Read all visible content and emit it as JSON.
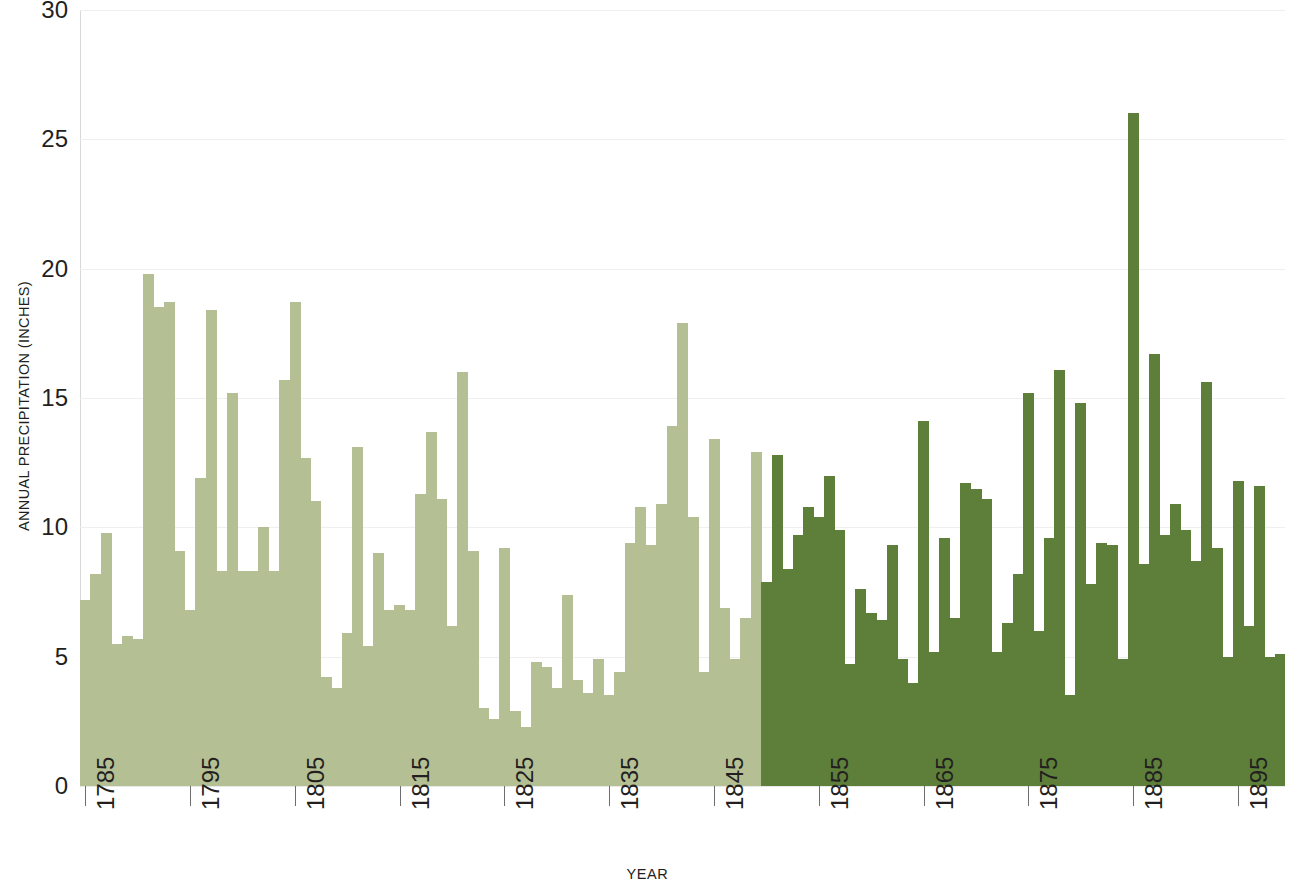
{
  "chart_data": {
    "type": "bar",
    "title": "",
    "subtitle": "",
    "xlabel": "YEAR",
    "ylabel": "ANNUAL PRECIPITATION (INCHES)",
    "ylabel_first_letters": "APRECIPITATIONINCHES",
    "ylim": [
      0,
      30
    ],
    "xlim": [
      1785,
      1899
    ],
    "y_ticks": [
      0,
      5,
      10,
      15,
      20,
      25,
      30
    ],
    "y_tick_labels": [
      "0",
      "5",
      "10",
      "15",
      "20",
      "25",
      "30"
    ],
    "x_ticks": [
      1785,
      1795,
      1805,
      1815,
      1825,
      1835,
      1845,
      1855,
      1865,
      1875,
      1885,
      1895
    ],
    "x_tick_labels": [
      "1785",
      "1795",
      "1805",
      "1815",
      "1825",
      "1835",
      "1845",
      "1855",
      "1865",
      "1875",
      "1885",
      "1895"
    ],
    "grid": true,
    "grid_axis": "y",
    "legend": false,
    "bar_gap": 0,
    "series": [
      {
        "name": "Annual precipitation (early period)",
        "color": "#b5bf94",
        "year_range": [
          1785,
          1849
        ]
      },
      {
        "name": "Annual precipitation (later period)",
        "color": "#5d7f3a",
        "year_range": [
          1850,
          1899
        ]
      }
    ],
    "color_split_year": 1850,
    "categories": [
      1785,
      1786,
      1787,
      1788,
      1789,
      1790,
      1791,
      1792,
      1793,
      1794,
      1795,
      1796,
      1797,
      1798,
      1799,
      1800,
      1801,
      1802,
      1803,
      1804,
      1805,
      1806,
      1807,
      1808,
      1809,
      1810,
      1811,
      1812,
      1813,
      1814,
      1815,
      1816,
      1817,
      1818,
      1819,
      1820,
      1821,
      1822,
      1823,
      1824,
      1825,
      1826,
      1827,
      1828,
      1829,
      1830,
      1831,
      1832,
      1833,
      1834,
      1835,
      1836,
      1837,
      1838,
      1839,
      1840,
      1841,
      1842,
      1843,
      1844,
      1845,
      1846,
      1847,
      1848,
      1849,
      1850,
      1851,
      1852,
      1853,
      1854,
      1855,
      1856,
      1857,
      1858,
      1859,
      1860,
      1861,
      1862,
      1863,
      1864,
      1865,
      1866,
      1867,
      1868,
      1869,
      1870,
      1871,
      1872,
      1873,
      1874,
      1875,
      1876,
      1877,
      1878,
      1879,
      1880,
      1881,
      1882,
      1883,
      1884,
      1885,
      1886,
      1887,
      1888,
      1889,
      1890,
      1891,
      1892,
      1893,
      1894,
      1895,
      1896,
      1897,
      1898,
      1899
    ],
    "values": [
      7.2,
      8.2,
      9.8,
      5.5,
      5.8,
      5.7,
      19.8,
      18.5,
      18.7,
      9.1,
      6.8,
      11.9,
      18.4,
      8.3,
      15.2,
      8.3,
      8.3,
      10.0,
      8.3,
      15.7,
      18.7,
      12.7,
      11.0,
      4.2,
      3.8,
      5.9,
      13.1,
      5.4,
      9.0,
      6.8,
      7.0,
      6.8,
      11.3,
      13.7,
      11.1,
      6.2,
      16.0,
      9.1,
      3.0,
      2.6,
      9.2,
      2.9,
      2.3,
      4.8,
      4.6,
      3.8,
      7.4,
      4.1,
      3.6,
      4.9,
      3.5,
      4.4,
      9.4,
      10.8,
      9.3,
      10.9,
      13.9,
      17.9,
      10.4,
      4.4,
      13.4,
      6.9,
      4.9,
      6.5,
      12.9,
      7.9,
      12.8,
      8.4,
      9.7,
      10.8,
      10.4,
      12.0,
      9.9,
      4.7,
      7.6,
      6.7,
      6.4,
      9.3,
      4.9,
      4.0,
      14.1,
      5.2,
      9.6,
      6.5,
      11.7,
      11.5,
      11.1,
      5.2,
      6.3,
      8.2,
      15.2,
      6.0,
      9.6,
      16.1,
      3.5,
      14.8,
      7.8,
      9.4,
      9.3,
      4.9,
      26.0,
      8.6,
      16.7,
      9.7,
      10.9,
      9.9,
      8.7,
      15.6,
      9.2,
      5.0,
      11.8,
      6.2,
      11.6,
      5.0,
      5.1
    ]
  },
  "axis": {
    "y_title": "ANNUAL PRECIPITATION (INCHES)",
    "x_title": "YEAR"
  }
}
